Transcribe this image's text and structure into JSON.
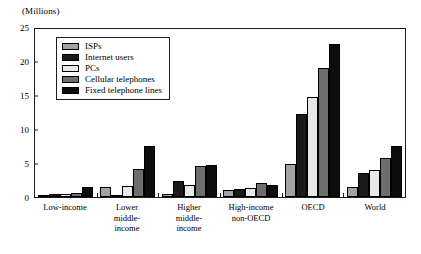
{
  "chart_data": {
    "type": "bar",
    "title": "",
    "subtitle": "",
    "unit_label": "(Millions)",
    "xlabel": "",
    "ylabel": "",
    "ylim": [
      0,
      25
    ],
    "yticks": [
      0,
      5,
      10,
      15,
      20,
      25
    ],
    "grid": false,
    "legend_position": "top-left inside plot",
    "categories": [
      "Low-income",
      "Lower\nmiddle-\nincome",
      "Higher\nmiddle-\nincome",
      "High-income\nnon-OECD",
      "OECD",
      "World"
    ],
    "series": [
      {
        "name": "ISPs",
        "color": "#a3a3a3",
        "values": [
          0.25,
          1.5,
          0.5,
          1.1,
          4.9,
          1.4
        ]
      },
      {
        "name": "Internet users",
        "color": "#1a1a1a",
        "values": [
          0.4,
          0.15,
          2.3,
          1.15,
          12.2,
          3.5
        ]
      },
      {
        "name": "PCs",
        "color": "#e8e8e8",
        "values": [
          0.5,
          1.6,
          1.8,
          1.3,
          14.7,
          4.0
        ]
      },
      {
        "name": "Cellular telephones",
        "color": "#6e6e6e",
        "values": [
          0.6,
          4.1,
          4.6,
          2.1,
          19.0,
          5.7
        ]
      },
      {
        "name": "Fixed telephone lines",
        "color": "#0d0d0d",
        "values": [
          1.5,
          7.5,
          4.65,
          1.8,
          22.5,
          7.5
        ]
      }
    ]
  },
  "colors": {
    "axis": "#1b1b1b",
    "background": "#ffffff",
    "bar_outline": "#000000"
  }
}
